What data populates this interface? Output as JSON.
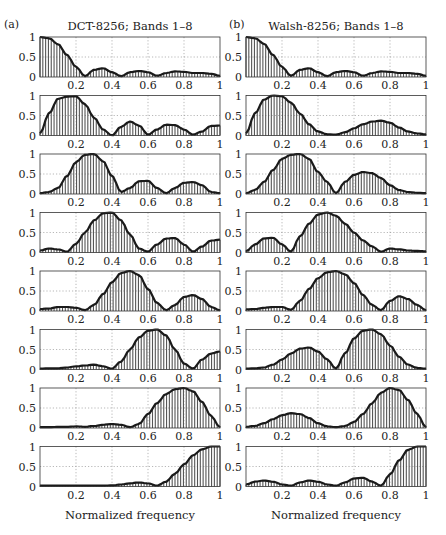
{
  "figure": {
    "left_panel_label": "(a)",
    "right_panel_label": "(b)",
    "left_title": "DCT-8256; Bands 1–8",
    "right_title": "Walsh-8256; Bands 1–8",
    "xlabel": "Normalized frequency",
    "colors": {
      "stem": "#555555",
      "envelope": "#1a1a1a",
      "grid": "#888888",
      "frame": "#333333"
    }
  },
  "chart_data": [
    {
      "type": "bar",
      "title": "DCT-8256; Bands 1–8",
      "panel": "(a)",
      "xlabel": "Normalized frequency",
      "ylabel": "",
      "xlim": [
        0,
        1
      ],
      "ylim": [
        0,
        1
      ],
      "xticks": [
        0.2,
        0.4,
        0.6,
        0.8,
        1
      ],
      "yticks": [
        0,
        0.5,
        1
      ],
      "grid": true,
      "x": [
        0,
        0.05,
        0.1,
        0.15,
        0.2,
        0.25,
        0.3,
        0.35,
        0.4,
        0.45,
        0.5,
        0.55,
        0.6,
        0.65,
        0.7,
        0.75,
        0.8,
        0.85,
        0.9,
        0.95,
        1.0
      ],
      "series": [
        {
          "name": "Band 1",
          "values": [
            1.0,
            0.97,
            0.82,
            0.55,
            0.25,
            0.02,
            0.18,
            0.22,
            0.12,
            0.02,
            0.12,
            0.15,
            0.12,
            0.03,
            0.1,
            0.14,
            0.13,
            0.1,
            0.1,
            0.08,
            0.03
          ]
        },
        {
          "name": "Band 2",
          "values": [
            0.05,
            0.55,
            0.92,
            0.97,
            0.98,
            0.78,
            0.45,
            0.15,
            0.0,
            0.22,
            0.35,
            0.25,
            0.02,
            0.15,
            0.27,
            0.26,
            0.15,
            0.02,
            0.1,
            0.24,
            0.25
          ]
        },
        {
          "name": "Band 3",
          "values": [
            0.02,
            0.05,
            0.15,
            0.45,
            0.8,
            0.98,
            1.0,
            0.82,
            0.45,
            0.05,
            0.15,
            0.32,
            0.33,
            0.15,
            0.02,
            0.15,
            0.28,
            0.3,
            0.22,
            0.05,
            0.02
          ]
        },
        {
          "name": "Band 4",
          "values": [
            0.05,
            0.1,
            0.08,
            0.02,
            0.22,
            0.5,
            0.8,
            0.98,
            1.0,
            0.8,
            0.45,
            0.1,
            0.02,
            0.2,
            0.35,
            0.36,
            0.2,
            0.02,
            0.15,
            0.3,
            0.32
          ]
        },
        {
          "name": "Band 5",
          "values": [
            0.05,
            0.06,
            0.1,
            0.1,
            0.08,
            0.02,
            0.15,
            0.42,
            0.72,
            0.95,
            1.0,
            0.9,
            0.55,
            0.2,
            0.02,
            0.15,
            0.35,
            0.4,
            0.3,
            0.1,
            0.02
          ]
        },
        {
          "name": "Band 6",
          "values": [
            0.02,
            0.03,
            0.03,
            0.05,
            0.08,
            0.1,
            0.12,
            0.08,
            0.02,
            0.2,
            0.5,
            0.8,
            0.97,
            1.0,
            0.85,
            0.5,
            0.15,
            0.02,
            0.25,
            0.4,
            0.45
          ]
        },
        {
          "name": "Band 7",
          "values": [
            0.02,
            0.02,
            0.03,
            0.03,
            0.04,
            0.03,
            0.05,
            0.08,
            0.1,
            0.08,
            0.02,
            0.1,
            0.35,
            0.62,
            0.85,
            0.97,
            1.0,
            0.92,
            0.65,
            0.3,
            0.02
          ]
        },
        {
          "name": "Band 8",
          "values": [
            0.02,
            0.02,
            0.02,
            0.02,
            0.02,
            0.02,
            0.02,
            0.02,
            0.03,
            0.05,
            0.08,
            0.1,
            0.08,
            0.02,
            0.12,
            0.32,
            0.55,
            0.78,
            0.93,
            1.0,
            1.0
          ]
        }
      ]
    },
    {
      "type": "bar",
      "title": "Walsh-8256; Bands 1–8",
      "panel": "(b)",
      "xlabel": "Normalized frequency",
      "ylabel": "",
      "xlim": [
        0,
        1
      ],
      "ylim": [
        0,
        1
      ],
      "xticks": [
        0.2,
        0.4,
        0.6,
        0.8,
        1
      ],
      "yticks": [
        0,
        0.5,
        1
      ],
      "grid": true,
      "x": [
        0,
        0.05,
        0.1,
        0.15,
        0.2,
        0.25,
        0.3,
        0.35,
        0.4,
        0.45,
        0.5,
        0.55,
        0.6,
        0.65,
        0.7,
        0.75,
        0.8,
        0.85,
        0.9,
        0.95,
        1.0
      ],
      "series": [
        {
          "name": "Band 1",
          "values": [
            1.0,
            0.97,
            0.83,
            0.55,
            0.25,
            0.03,
            0.18,
            0.22,
            0.12,
            0.02,
            0.12,
            0.15,
            0.12,
            0.03,
            0.1,
            0.14,
            0.13,
            0.1,
            0.1,
            0.08,
            0.03
          ]
        },
        {
          "name": "Band 2",
          "values": [
            0.05,
            0.55,
            0.9,
            1.0,
            0.98,
            0.82,
            0.55,
            0.28,
            0.1,
            0.03,
            0.02,
            0.08,
            0.18,
            0.28,
            0.35,
            0.37,
            0.32,
            0.2,
            0.1,
            0.05,
            0.03
          ]
        },
        {
          "name": "Band 3",
          "values": [
            0.02,
            0.1,
            0.3,
            0.6,
            0.88,
            0.98,
            1.0,
            0.88,
            0.55,
            0.3,
            0.02,
            0.3,
            0.48,
            0.55,
            0.52,
            0.4,
            0.22,
            0.1,
            0.05,
            0.03,
            0.02
          ]
        },
        {
          "name": "Band 4",
          "values": [
            0.03,
            0.2,
            0.35,
            0.37,
            0.2,
            0.02,
            0.4,
            0.72,
            0.95,
            1.0,
            0.92,
            0.72,
            0.5,
            0.3,
            0.15,
            0.02,
            0.1,
            0.08,
            0.05,
            0.04,
            0.03
          ]
        },
        {
          "name": "Band 5",
          "values": [
            0.04,
            0.05,
            0.08,
            0.1,
            0.1,
            0.03,
            0.25,
            0.55,
            0.82,
            0.97,
            1.0,
            0.92,
            0.7,
            0.4,
            0.15,
            0.02,
            0.25,
            0.37,
            0.3,
            0.15,
            0.02
          ]
        },
        {
          "name": "Band 6",
          "values": [
            0.02,
            0.03,
            0.05,
            0.12,
            0.25,
            0.4,
            0.52,
            0.55,
            0.45,
            0.25,
            0.02,
            0.4,
            0.78,
            0.97,
            1.0,
            0.88,
            0.6,
            0.32,
            0.12,
            0.04,
            0.02
          ]
        },
        {
          "name": "Band 7",
          "values": [
            0.03,
            0.05,
            0.12,
            0.22,
            0.32,
            0.37,
            0.35,
            0.25,
            0.12,
            0.04,
            0.02,
            0.05,
            0.15,
            0.35,
            0.62,
            0.88,
            1.0,
            0.95,
            0.7,
            0.35,
            0.02
          ]
        },
        {
          "name": "Band 8",
          "values": [
            0.05,
            0.12,
            0.15,
            0.12,
            0.05,
            0.02,
            0.1,
            0.15,
            0.12,
            0.05,
            0.02,
            0.1,
            0.2,
            0.22,
            0.12,
            0.02,
            0.3,
            0.65,
            0.92,
            1.0,
            1.0
          ]
        }
      ]
    }
  ]
}
